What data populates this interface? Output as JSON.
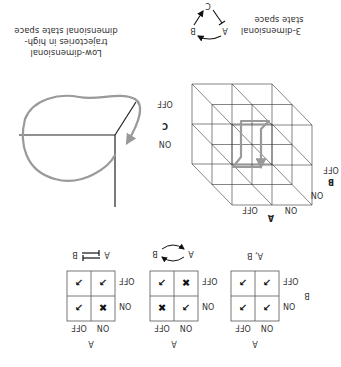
{
  "figure": {
    "orientation": "rotated-180",
    "truth_tables": [
      {
        "id": "independent",
        "top_axis_label": "A",
        "side_axis_label": "B",
        "col_labels": [
          "ON",
          "OFF"
        ],
        "row_labels": [
          "ON",
          "OFF"
        ],
        "cells": [
          [
            "allowed",
            "allowed"
          ],
          [
            "allowed",
            "allowed"
          ]
        ],
        "caption": "A, B"
      },
      {
        "id": "cycle",
        "top_axis_label": "A",
        "col_labels": [
          "ON",
          "OFF"
        ],
        "row_labels": [
          "ON",
          "OFF"
        ],
        "cells": [
          [
            "allowed",
            "forbidden"
          ],
          [
            "forbidden",
            "allowed"
          ]
        ],
        "caption_left": "A",
        "caption_right": "B"
      },
      {
        "id": "mutual-inhibition",
        "top_axis_label": "A",
        "col_labels": [
          "ON",
          "OFF"
        ],
        "row_labels": [
          "ON",
          "OFF"
        ],
        "cells": [
          [
            "forbidden",
            "allowed"
          ],
          [
            "allowed",
            "allowed"
          ]
        ],
        "caption_left": "A",
        "caption_right": "B"
      }
    ],
    "symbols": {
      "allowed": "↗",
      "forbidden": "✖"
    },
    "cube": {
      "axis_a_label": "A",
      "axis_b_label": "B",
      "axis_c_label": "C",
      "a_ticks": [
        "ON",
        "OFF"
      ],
      "b_ticks": [
        "ON",
        "OFF"
      ],
      "c_ticks": [
        "ON",
        "OFF"
      ],
      "caption_line1": "3-dimensional",
      "caption_line2": "state space",
      "network": {
        "node_a": "A",
        "node_b": "B",
        "node_c": "C"
      }
    },
    "trajectory": {
      "caption_line1": "Low-dimensional",
      "caption_line2": "trajectories in high-",
      "caption_line3": "dimensional state space"
    }
  }
}
